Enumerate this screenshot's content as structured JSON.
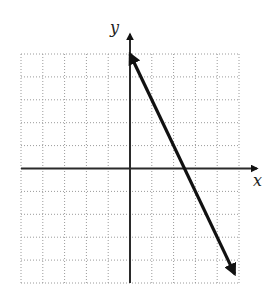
{
  "chart_data": {
    "type": "line",
    "title": "",
    "xlabel": "x",
    "ylabel": "y",
    "xlim": [
      -5,
      5
    ],
    "ylim": [
      -5,
      5
    ],
    "grid": true,
    "grid_step": 1,
    "series": [
      {
        "name": "line",
        "equation": "y = -2x + 5",
        "slope": -2,
        "y_intercept": 5,
        "x_intercept": 2.5,
        "x": [
          0,
          4.8
        ],
        "y": [
          5,
          -4.6
        ],
        "arrows": "both ends"
      }
    ]
  }
}
